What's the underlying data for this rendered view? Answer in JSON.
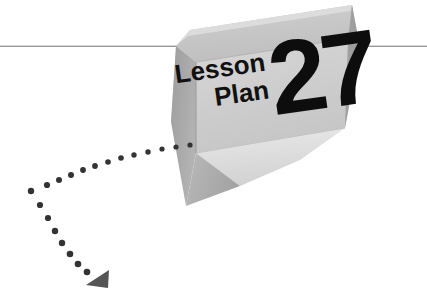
{
  "page": {
    "width": 427,
    "height": 293,
    "background_color": "#ffffff",
    "kind": "decorative-chapter-header-graphic"
  },
  "header": {
    "label_line1": "Lesson",
    "label_line2": "Plan",
    "number": "27",
    "label_color": "#111111",
    "number_color": "#0d0d0d"
  },
  "rule": {
    "name": "horizontal-rule",
    "color": "#9a9a9a",
    "y": 46,
    "thickness": 1.4
  },
  "block": {
    "name": "3d-angled-slab",
    "face_top_color": "#c9c9c9",
    "face_front_color": "#d7d7d7",
    "face_side_color": "#a6a6a6",
    "face_bevel_color": "#b5b5b5",
    "face_highlight_color": "#e6e6e6",
    "edge_color": "#8f8f8f"
  },
  "trail": {
    "name": "dotted-path",
    "dot_color": "#333333",
    "arrow_color": "#555555",
    "dot_count": 23,
    "vertex": {
      "x": 30,
      "y": 190
    },
    "dots": [
      {
        "x": 190,
        "y": 145,
        "r": 2.6
      },
      {
        "x": 176,
        "y": 147,
        "r": 2.6
      },
      {
        "x": 162,
        "y": 149,
        "r": 2.6
      },
      {
        "x": 148,
        "y": 152,
        "r": 2.7
      },
      {
        "x": 134,
        "y": 155,
        "r": 2.7
      },
      {
        "x": 121,
        "y": 158,
        "r": 2.8
      },
      {
        "x": 108,
        "y": 162,
        "r": 2.8
      },
      {
        "x": 95,
        "y": 166,
        "r": 2.9
      },
      {
        "x": 83,
        "y": 170,
        "r": 2.9
      },
      {
        "x": 71,
        "y": 175,
        "r": 3.0
      },
      {
        "x": 59,
        "y": 180,
        "r": 3.0
      },
      {
        "x": 47,
        "y": 185,
        "r": 3.1
      },
      {
        "x": 31,
        "y": 191,
        "r": 3.2
      },
      {
        "x": 40,
        "y": 205,
        "r": 3.1
      },
      {
        "x": 48,
        "y": 218,
        "r": 3.1
      },
      {
        "x": 55,
        "y": 231,
        "r": 3.2
      },
      {
        "x": 62,
        "y": 243,
        "r": 3.2
      },
      {
        "x": 70,
        "y": 254,
        "r": 3.3
      },
      {
        "x": 78,
        "y": 264,
        "r": 3.3
      },
      {
        "x": 87,
        "y": 272,
        "r": 3.3
      }
    ],
    "arrow": {
      "x": 99,
      "y": 276
    }
  }
}
